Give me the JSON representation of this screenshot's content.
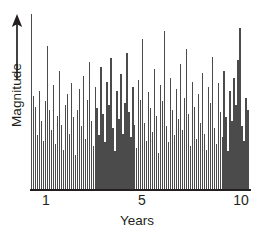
{
  "chart_data": {
    "type": "bar",
    "title": "",
    "xlabel": "Years",
    "ylabel": "Magnitude",
    "grid": false,
    "legend": null,
    "xlim": [
      0.8,
      10.2
    ],
    "ylim": [
      0,
      100
    ],
    "xticks": [
      1,
      5,
      10
    ],
    "xtick_labels": [
      "1",
      "5",
      "10"
    ],
    "yticks": [],
    "ytick_labels": [],
    "y_axis_arrow": "up-arrow",
    "bar_color": "#4b4b4b",
    "background_color": "#ffffff",
    "axis_color": "#231f20",
    "n_bars": 110,
    "x": [
      1.0,
      1.09,
      1.17,
      1.26,
      1.34,
      1.43,
      1.51,
      1.6,
      1.69,
      1.77,
      1.86,
      1.94,
      2.03,
      2.11,
      2.2,
      2.29,
      2.37,
      2.46,
      2.54,
      2.63,
      2.71,
      2.8,
      2.89,
      2.97,
      3.06,
      3.14,
      3.23,
      3.31,
      3.4,
      3.49,
      3.57,
      3.66,
      3.74,
      3.83,
      3.91,
      4.0,
      4.09,
      4.17,
      4.26,
      4.34,
      4.43,
      4.51,
      4.6,
      4.69,
      4.77,
      4.86,
      4.94,
      5.03,
      5.11,
      5.2,
      5.29,
      5.37,
      5.46,
      5.54,
      5.63,
      5.71,
      5.8,
      5.89,
      5.97,
      6.06,
      6.14,
      6.23,
      6.31,
      6.4,
      6.49,
      6.57,
      6.66,
      6.74,
      6.83,
      6.91,
      7.0,
      7.09,
      7.17,
      7.26,
      7.34,
      7.43,
      7.51,
      7.6,
      7.69,
      7.77,
      7.86,
      7.94,
      8.03,
      8.11,
      8.2,
      8.29,
      8.37,
      8.46,
      8.54,
      8.63,
      8.71,
      8.8,
      8.89,
      8.97,
      9.06,
      9.14,
      9.23,
      9.31,
      9.4,
      9.49,
      9.57,
      9.66,
      9.74,
      9.83,
      9.91,
      10.0,
      10.03,
      10.06,
      10.09,
      10.11
    ],
    "values": [
      98,
      52,
      46,
      30,
      55,
      38,
      27,
      49,
      80,
      44,
      33,
      58,
      25,
      41,
      66,
      36,
      22,
      47,
      53,
      31,
      59,
      40,
      19,
      44,
      56,
      35,
      63,
      28,
      50,
      71,
      38,
      24,
      57,
      45,
      30,
      68,
      42,
      26,
      60,
      47,
      73,
      34,
      21,
      55,
      39,
      64,
      31,
      48,
      76,
      43,
      29,
      57,
      36,
      23,
      61,
      50,
      84,
      37,
      27,
      54,
      45,
      32,
      67,
      41,
      20,
      58,
      49,
      88,
      35,
      26,
      62,
      44,
      30,
      56,
      39,
      70,
      33,
      51,
      78,
      42,
      24,
      60,
      46,
      28,
      53,
      37,
      65,
      31,
      22,
      57,
      48,
      74,
      34,
      25,
      59,
      43,
      29,
      66,
      40,
      21,
      55,
      38,
      62,
      47,
      72,
      90,
      35,
      27,
      51,
      44
    ]
  },
  "axes": {
    "y_title": "Magnitude",
    "x_title": "Years",
    "x_tick_1": "1",
    "x_tick_5": "5",
    "x_tick_10": "10"
  }
}
